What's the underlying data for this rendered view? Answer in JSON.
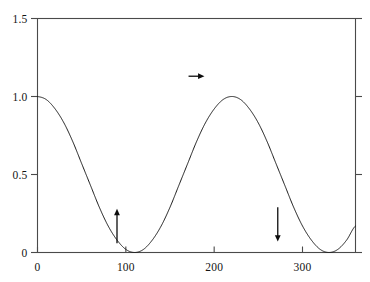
{
  "chart_data": {
    "type": "line",
    "title": "",
    "subtitle": "",
    "xlabel": "",
    "ylabel": "",
    "xlim": [
      0,
      360
    ],
    "ylim": [
      0,
      1.5
    ],
    "grid": false,
    "legend": "none",
    "x_ticks": [
      {
        "value": 0,
        "label": "0"
      },
      {
        "value": 100,
        "label": "100"
      },
      {
        "value": 200,
        "label": "200"
      },
      {
        "value": 300,
        "label": "300"
      }
    ],
    "y_ticks": [
      {
        "value": 0,
        "label": "0"
      },
      {
        "value": 0.5,
        "label": "0.5"
      },
      {
        "value": 1.0,
        "label": "1.0"
      },
      {
        "value": 1.5,
        "label": "1.5"
      }
    ],
    "series": [
      {
        "name": "cos^2(x/2)",
        "color": "#1a1a1a",
        "linewidth": 1,
        "x": [
          0,
          10,
          20,
          30,
          40,
          50,
          60,
          70,
          80,
          90,
          100,
          110,
          120,
          130,
          140,
          150,
          160,
          170,
          180,
          190,
          200,
          210,
          220,
          230,
          240,
          250,
          260,
          270,
          280,
          290,
          300,
          310,
          320,
          330,
          340,
          350,
          360
        ],
        "values": [
          1.0,
          0.98,
          0.92,
          0.83,
          0.71,
          0.57,
          0.43,
          0.29,
          0.17,
          0.08,
          0.02,
          0.0,
          0.02,
          0.08,
          0.17,
          0.29,
          0.43,
          0.57,
          0.71,
          0.83,
          0.92,
          0.98,
          1.0,
          0.98,
          0.92,
          0.83,
          0.71,
          0.57,
          0.43,
          0.29,
          0.17,
          0.08,
          0.02,
          0.0,
          0.02,
          0.08,
          0.17
        ]
      }
    ],
    "curve_features": {
      "maxima": [
        {
          "x": 0,
          "y": 1.0
        },
        {
          "x": 180,
          "y": 1.0
        },
        {
          "x": 360,
          "y": 1.0
        }
      ],
      "minima": [
        {
          "x": 90,
          "y": 0.0
        },
        {
          "x": 270,
          "y": 0.0
        }
      ]
    },
    "annotations": [
      {
        "name": "up-arrow",
        "direction": "up",
        "x": 90,
        "y": 0.17,
        "length": 0.11
      },
      {
        "name": "right-arrow",
        "direction": "right",
        "x": 180,
        "y": 1.13,
        "length": 9
      },
      {
        "name": "down-arrow",
        "direction": "down",
        "x": 272,
        "y": 0.18,
        "length": 0.11
      }
    ]
  }
}
